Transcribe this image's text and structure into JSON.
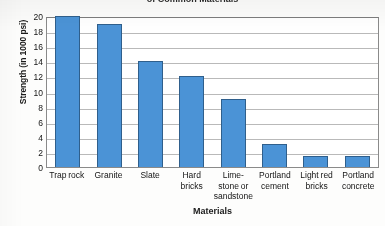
{
  "chart_data": {
    "type": "bar",
    "title": "of Common Materials",
    "xlabel": "Materials",
    "ylabel": "Strength (in 1000 psi)",
    "categories": [
      "Trap rock",
      "Granite",
      "Slate",
      "Hard bricks",
      "Lime- stone or sandstone",
      "Portland cement",
      "Light red bricks",
      "Portland concrete"
    ],
    "values": [
      20,
      19,
      14,
      12,
      9,
      3,
      1.5,
      1.5
    ],
    "ylim": [
      0,
      20
    ],
    "yticks": [
      "0",
      "2",
      "4",
      "6",
      "8",
      "10",
      "12",
      "14",
      "16",
      "18",
      "20"
    ],
    "grid": true,
    "legend": "none",
    "bar_color": "#4b93d6",
    "bar_border_color": "#2f5f8c",
    "gridline_color": "#b9b9b9"
  }
}
